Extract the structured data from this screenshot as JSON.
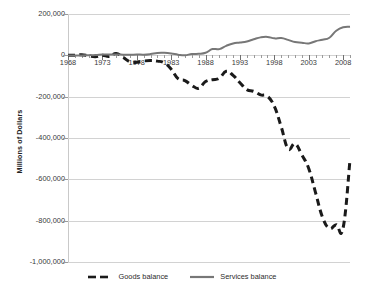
{
  "chart_data": {
    "type": "line",
    "title": "",
    "xlabel": "",
    "ylabel": "Millions of Dollars",
    "xlim": [
      1968,
      2009
    ],
    "ylim": [
      -1000000,
      200000
    ],
    "grid": true,
    "legend_position": "bottom-center",
    "y_ticks": [
      200000,
      0,
      -200000,
      -400000,
      -600000,
      -800000,
      -1000000
    ],
    "y_tick_labels": [
      "200,000",
      "0",
      "-200,000",
      "-400,000",
      "-600,000",
      "-800,000",
      "-1,000,000"
    ],
    "x_ticks": [
      1968,
      1973,
      1978,
      1983,
      1988,
      1993,
      1998,
      2003,
      2008
    ],
    "x_tick_labels": [
      "1968",
      "1973",
      "1978",
      "1983",
      "1988",
      "1993",
      "1998",
      "2003",
      "2008"
    ],
    "x_minor_tick_interval": 1,
    "x": [
      1968,
      1969,
      1970,
      1971,
      1972,
      1973,
      1974,
      1975,
      1976,
      1977,
      1978,
      1979,
      1980,
      1981,
      1982,
      1983,
      1984,
      1985,
      1986,
      1987,
      1988,
      1989,
      1990,
      1991,
      1992,
      1993,
      1994,
      1995,
      1996,
      1997,
      1998,
      1999,
      2000,
      2001,
      2002,
      2003,
      2004,
      2005,
      2006,
      2007,
      2008,
      2009
    ],
    "series": [
      {
        "name": "Goods balance",
        "color": "#1a1a1a",
        "style": "dashed",
        "width": 3.0,
        "values": [
          624,
          607,
          2603,
          -2260,
          -6416,
          911,
          -5505,
          8903,
          -9483,
          -31091,
          -33927,
          -27568,
          -25500,
          -28023,
          -36485,
          -67102,
          -112492,
          -122173,
          -145081,
          -159557,
          -126959,
          -117749,
          -111037,
          -76937,
          -96897,
          -132451,
          -165831,
          -174170,
          -191000,
          -198428,
          -246687,
          -346000,
          -452414,
          -427168,
          -482289,
          -547553,
          -665390,
          -782804,
          -837289,
          -819373,
          -834655,
          -505905
        ]
      },
      {
        "name": "Services balance",
        "color": "#777777",
        "style": "solid",
        "width": 2.0,
        "values": [
          -385,
          -510,
          -349,
          956,
          1245,
          3825,
          4203,
          3501,
          3401,
          2279,
          4158,
          3005,
          6093,
          11852,
          12329,
          9335,
          3361,
          294,
          6300,
          7437,
          12394,
          30230,
          30173,
          45802,
          57675,
          62141,
          67336,
          77786,
          86934,
          89305,
          82093,
          83545,
          74864,
          64384,
          61032,
          57787,
          68582,
          75584,
          84951,
          119078,
          135866,
          138443
        ]
      }
    ]
  },
  "legend": {
    "items": [
      {
        "label": "Goods balance",
        "marker": "dashed-line-marker"
      },
      {
        "label": "Services balance",
        "marker": "solid-line-marker"
      }
    ]
  }
}
